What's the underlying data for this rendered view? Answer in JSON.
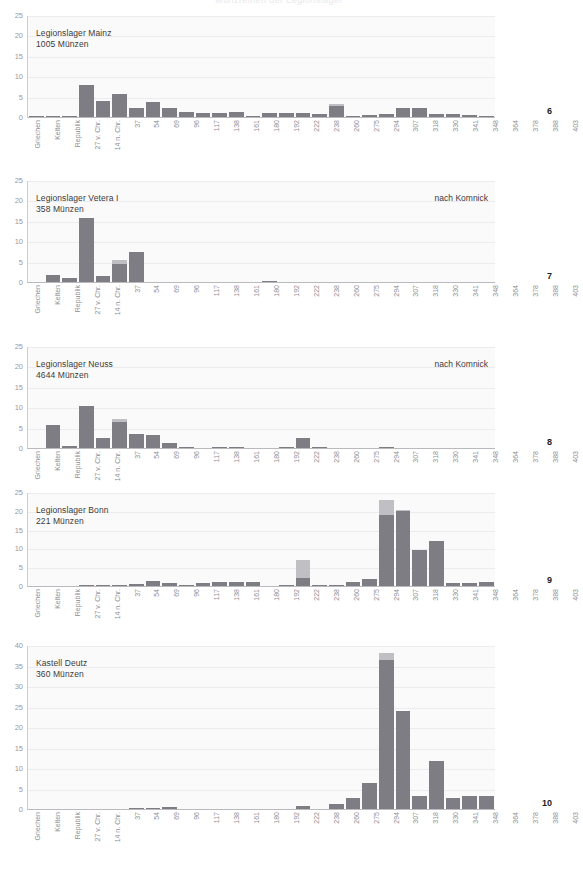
{
  "masthead": {
    "text": "Münzreihen der Legionslager"
  },
  "categories": [
    "Griechen",
    "Kelten",
    "Republik",
    "27 v. Chr.",
    "14 n. Chr.",
    "37",
    "54",
    "69",
    "96",
    "117",
    "138",
    "161",
    "180",
    "192",
    "222",
    "238",
    "260",
    "275",
    "294",
    "307",
    "318",
    "330",
    "341",
    "348",
    "364",
    "378",
    "388",
    "403"
  ],
  "colors": {
    "bar_main": "#7d7d83",
    "bar_top": "#bfbfc4",
    "plot_bg": "#fafafa",
    "grid": "#ececf0",
    "tick_text": "#9a9a9e",
    "title_text": "#3a3a3c"
  },
  "chart_data": [
    {
      "type": "bar",
      "title": "Legionslager Mainz\n1005 Münzen",
      "note": "",
      "page": "6",
      "ylim": [
        0,
        25
      ],
      "yticks": [
        0,
        5,
        10,
        15,
        20,
        25
      ],
      "ylabel": "",
      "xlabel": "",
      "grid": true,
      "legend": "none",
      "categories": [
        "Griechen",
        "Kelten",
        "Republik",
        "27 v. Chr.",
        "14 n. Chr.",
        "37",
        "54",
        "69",
        "96",
        "117",
        "138",
        "161",
        "180",
        "192",
        "222",
        "238",
        "260",
        "275",
        "294",
        "307",
        "318",
        "330",
        "341",
        "348",
        "364",
        "378",
        "388",
        "403"
      ],
      "series": [
        {
          "name": "main",
          "values": [
            0.1,
            0.2,
            0.3,
            7.9,
            4.0,
            5.7,
            2.3,
            3.6,
            2.2,
            1.2,
            1.1,
            1.0,
            1.3,
            0.2,
            1.0,
            1.1,
            1.0,
            0.8,
            2.6,
            0.1,
            0.4,
            0.8,
            2.2,
            2.3,
            0.7,
            0.7,
            0.6,
            0.1
          ]
        },
        {
          "name": "top",
          "values": [
            0,
            0,
            0,
            0,
            0,
            0,
            0,
            0,
            0,
            0,
            0,
            0,
            0,
            0,
            0,
            0,
            0,
            0,
            0.5,
            0,
            0,
            0,
            0,
            0,
            0,
            0,
            0,
            0
          ]
        }
      ]
    },
    {
      "type": "bar",
      "title": "Legionslager Vetera I\n358 Münzen",
      "note": "nach Komnick",
      "page": "7",
      "ylim": [
        0,
        25
      ],
      "yticks": [
        0,
        5,
        10,
        15,
        20,
        25
      ],
      "ylabel": "",
      "xlabel": "",
      "grid": true,
      "legend": "none",
      "categories": [
        "Griechen",
        "Kelten",
        "Republik",
        "27 v. Chr.",
        "14 n. Chr.",
        "37",
        "54",
        "69",
        "96",
        "117",
        "138",
        "161",
        "180",
        "192",
        "222",
        "238",
        "260",
        "275",
        "294",
        "307",
        "318",
        "330",
        "341",
        "348",
        "364",
        "378",
        "388",
        "403"
      ],
      "series": [
        {
          "name": "main",
          "values": [
            0,
            1.7,
            1.0,
            15.6,
            1.4,
            4.4,
            7.3,
            0,
            0,
            0,
            0,
            0,
            0,
            0,
            0.3,
            0,
            0,
            0,
            0,
            0,
            0,
            0,
            0,
            0,
            0,
            0,
            0,
            0
          ]
        },
        {
          "name": "top",
          "values": [
            0,
            0,
            0,
            0,
            0,
            0.9,
            0,
            0,
            0,
            0,
            0,
            0,
            0,
            0,
            0,
            0,
            0,
            0,
            0,
            0,
            0,
            0,
            0,
            0,
            0,
            0,
            0,
            0
          ]
        }
      ]
    },
    {
      "type": "bar",
      "title": "Legionslager Neuss\n4644 Münzen",
      "note": "nach Komnick",
      "page": "8",
      "ylim": [
        0,
        25
      ],
      "yticks": [
        0,
        5,
        10,
        15,
        20,
        25
      ],
      "ylabel": "",
      "xlabel": "",
      "grid": true,
      "legend": "none",
      "categories": [
        "Griechen",
        "Kelten",
        "Republik",
        "27 v. Chr.",
        "14 n. Chr.",
        "37",
        "54",
        "69",
        "96",
        "117",
        "138",
        "161",
        "180",
        "192",
        "222",
        "238",
        "260",
        "275",
        "294",
        "307",
        "318",
        "330",
        "341",
        "348",
        "364",
        "378",
        "388",
        "403"
      ],
      "series": [
        {
          "name": "main",
          "values": [
            0,
            5.6,
            0.5,
            10.3,
            2.5,
            6.4,
            3.4,
            3.2,
            1.2,
            0.3,
            0,
            0.2,
            0.1,
            0,
            0,
            0.2,
            2.4,
            0.1,
            0,
            0,
            0,
            0.1,
            0,
            0,
            0,
            0,
            0,
            0
          ]
        },
        {
          "name": "top",
          "values": [
            0,
            0,
            0,
            0,
            0,
            0.8,
            0,
            0,
            0,
            0,
            0,
            0,
            0,
            0,
            0,
            0,
            0,
            0,
            0,
            0,
            0,
            0,
            0,
            0,
            0,
            0,
            0,
            0
          ]
        }
      ]
    },
    {
      "type": "bar",
      "title": "Legionslager Bonn\n221 Münzen",
      "note": "",
      "page": "9",
      "ylim": [
        0,
        25
      ],
      "yticks": [
        0,
        5,
        10,
        15,
        20,
        25
      ],
      "ylabel": "",
      "xlabel": "",
      "grid": true,
      "legend": "none",
      "categories": [
        "Griechen",
        "Kelten",
        "Republik",
        "27 v. Chr.",
        "14 n. Chr.",
        "37",
        "54",
        "69",
        "96",
        "117",
        "138",
        "161",
        "180",
        "192",
        "222",
        "238",
        "260",
        "275",
        "294",
        "307",
        "318",
        "330",
        "341",
        "348",
        "364",
        "378",
        "388",
        "403"
      ],
      "series": [
        {
          "name": "main",
          "values": [
            0,
            0,
            0,
            0.2,
            0.2,
            0.4,
            0.6,
            1.4,
            0.7,
            0.1,
            0.9,
            1.1,
            1.0,
            1.0,
            0,
            0.4,
            2.0,
            0.2,
            0.1,
            1.1,
            1.9,
            18.9,
            19.9,
            9.5,
            12.0,
            0.8,
            0.9,
            1.1
          ]
        },
        {
          "name": "top",
          "values": [
            0,
            0,
            0,
            0,
            0,
            0,
            0,
            0,
            0,
            0,
            0,
            0,
            0,
            0,
            0,
            0,
            4.9,
            0,
            0,
            0,
            0,
            4.0,
            0.2,
            0,
            0,
            0,
            0,
            0
          ]
        }
      ]
    },
    {
      "type": "bar",
      "title": "Kastell Deutz\n360 Münzen",
      "note": "",
      "page": "10",
      "ylim": [
        0,
        40
      ],
      "yticks": [
        0,
        5,
        10,
        15,
        20,
        25,
        30,
        35,
        40
      ],
      "ylabel": "",
      "xlabel": "",
      "grid": true,
      "legend": "none",
      "categories": [
        "Griechen",
        "Kelten",
        "Republik",
        "27 v. Chr.",
        "14 n. Chr.",
        "37",
        "54",
        "69",
        "96",
        "117",
        "138",
        "161",
        "180",
        "192",
        "222",
        "238",
        "260",
        "275",
        "294",
        "307",
        "318",
        "330",
        "341",
        "348",
        "364",
        "378",
        "388",
        "403"
      ],
      "series": [
        {
          "name": "main",
          "values": [
            0,
            0,
            0,
            0,
            0,
            0,
            0.2,
            0.1,
            0.5,
            0,
            0,
            0,
            0,
            0,
            0,
            0,
            0.8,
            0,
            1.3,
            2.6,
            6.3,
            36.4,
            23.8,
            3.2,
            11.7,
            2.6,
            3.2,
            3.2
          ]
        },
        {
          "name": "top",
          "values": [
            0,
            0,
            0,
            0,
            0,
            0,
            0,
            0,
            0,
            0,
            0,
            0,
            0,
            0,
            0,
            0,
            0,
            0,
            0,
            0,
            0,
            1.7,
            0,
            0,
            0,
            0,
            0,
            0
          ]
        }
      ]
    }
  ]
}
